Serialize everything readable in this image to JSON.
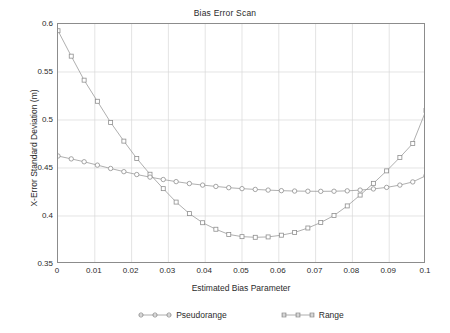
{
  "chart_data": {
    "type": "line",
    "title": "Bias Error Scan",
    "xlabel": "Estimated Bias Parameter",
    "ylabel": "X-Error Standard Deviation (m)",
    "xlim": [
      0,
      0.1
    ],
    "ylim": [
      0.35,
      0.6
    ],
    "xticks": [
      0,
      0.01,
      0.02,
      0.03,
      0.04,
      0.05,
      0.06,
      0.07,
      0.08,
      0.09,
      0.1
    ],
    "xtick_labels": [
      "0",
      "0.01",
      "0.02",
      "0.03",
      "0.04",
      "0.05",
      "0.06",
      "0.07",
      "0.08",
      "0.09",
      "0.1"
    ],
    "yticks": [
      0.35,
      0.4,
      0.45,
      0.5,
      0.55,
      0.6
    ],
    "ytick_labels": [
      "0.35",
      "0.4",
      "0.45",
      "0.5",
      "0.55",
      "0.6"
    ],
    "grid": true,
    "legend_position": "below",
    "x": [
      0,
      0.0036,
      0.0071,
      0.0107,
      0.0143,
      0.0179,
      0.0214,
      0.025,
      0.0286,
      0.0321,
      0.0357,
      0.0393,
      0.0429,
      0.0464,
      0.05,
      0.0536,
      0.0571,
      0.0607,
      0.0643,
      0.0679,
      0.0714,
      0.075,
      0.0786,
      0.0821,
      0.0857,
      0.0893,
      0.0929,
      0.0964,
      0.1
    ],
    "series": [
      {
        "name": "Pseudorange",
        "marker": "circle",
        "color": "#9a9a9a",
        "values": [
          0.4625,
          0.4595,
          0.4565,
          0.453,
          0.4495,
          0.4462,
          0.4432,
          0.4405,
          0.438,
          0.4358,
          0.4338,
          0.4322,
          0.4308,
          0.4295,
          0.4285,
          0.4277,
          0.427,
          0.4264,
          0.426,
          0.4258,
          0.4257,
          0.4258,
          0.4262,
          0.427,
          0.4282,
          0.4298,
          0.4322,
          0.4355,
          0.442
        ]
      },
      {
        "name": "Range",
        "marker": "square",
        "color": "#9a9a9a",
        "values": [
          0.593,
          0.5665,
          0.5415,
          0.5195,
          0.4975,
          0.478,
          0.46,
          0.4435,
          0.4285,
          0.4145,
          0.4025,
          0.393,
          0.3862,
          0.3808,
          0.3785,
          0.3778,
          0.3782,
          0.38,
          0.3828,
          0.3875,
          0.3932,
          0.4005,
          0.4105,
          0.4218,
          0.434,
          0.447,
          0.461,
          0.4755,
          0.51
        ]
      }
    ]
  }
}
